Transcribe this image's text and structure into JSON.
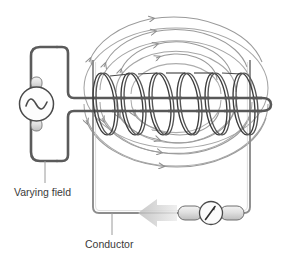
{
  "diagram": {
    "background_color": "#ffffff",
    "labels": {
      "varying_field": "Varying field",
      "conductor": "Conductor"
    },
    "components": {
      "ac_source": {
        "name": "ac-generator",
        "symbol": "~",
        "shape": "circle-with-sine-wave",
        "color": "#4a4a4a"
      },
      "primary_coil": {
        "name": "solenoid-coil",
        "turns": 6,
        "color": "#3c3c3c"
      },
      "core_wire": {
        "name": "core-conductor-wire",
        "color": "#555555"
      },
      "secondary_loop": {
        "name": "conductor-loop",
        "color": "#8a8a8a"
      },
      "meter": {
        "name": "galvanometer",
        "shape": "circle-with-needle",
        "color": "#4a4a4a"
      },
      "current_arrow": {
        "name": "induced-current-arrow",
        "direction": "left",
        "color": "#cfcfcf"
      },
      "field_lines": {
        "name": "magnetic-field-lines",
        "count": 8,
        "direction": "counter-clockwise",
        "color": "#9a9a9a"
      }
    },
    "colors": {
      "stroke_dark": "#3c3c3c",
      "stroke_mid": "#6b6b6b",
      "stroke_light": "#9a9a9a",
      "stroke_pale": "#bdbdbd",
      "fill_metal": "#e2e2e2",
      "text": "#3a3a3a",
      "arrow_fill": "#d2d2d2"
    }
  }
}
